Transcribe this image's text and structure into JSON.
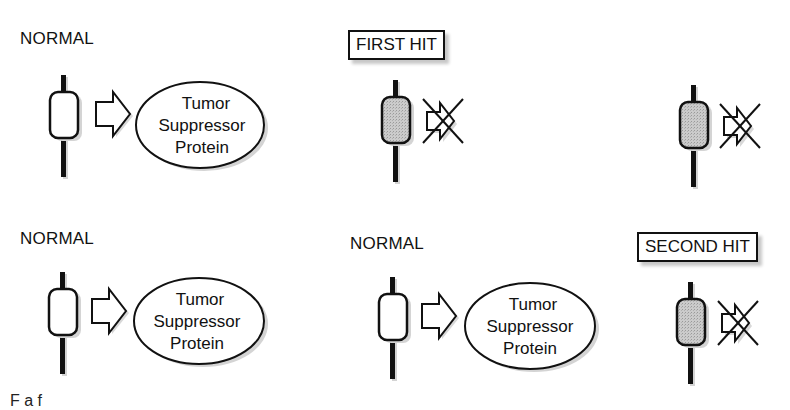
{
  "diagram": {
    "panels": [
      {
        "id": "top-left",
        "label": "NORMAL",
        "gene_state": "normal",
        "product": {
          "lines": [
            "Tumor",
            "Suppressor",
            "Protein"
          ]
        }
      },
      {
        "id": "top-middle",
        "label": "FIRST HIT",
        "label_boxed": true,
        "gene_state": "mutated",
        "product": null,
        "arrow": "blocked"
      },
      {
        "id": "top-right",
        "label": "",
        "gene_state": "mutated",
        "product": null,
        "arrow": "blocked"
      },
      {
        "id": "bottom-left",
        "label": "NORMAL",
        "gene_state": "normal",
        "product": {
          "lines": [
            "Tumor",
            "Suppressor",
            "Protein"
          ]
        }
      },
      {
        "id": "bottom-middle",
        "label": "NORMAL",
        "gene_state": "normal",
        "product": {
          "lines": [
            "Tumor",
            "Suppressor",
            "Protein"
          ]
        }
      },
      {
        "id": "bottom-right",
        "label": "SECOND HIT",
        "label_boxed": true,
        "gene_state": "mutated",
        "product": null,
        "arrow": "blocked"
      }
    ],
    "colors": {
      "stroke": "#111111",
      "mutated_fill": "#c4c4c4",
      "normal_fill": "#ffffff",
      "shadow": "#cfcfcf"
    },
    "caption_partial": "F              a      f"
  }
}
